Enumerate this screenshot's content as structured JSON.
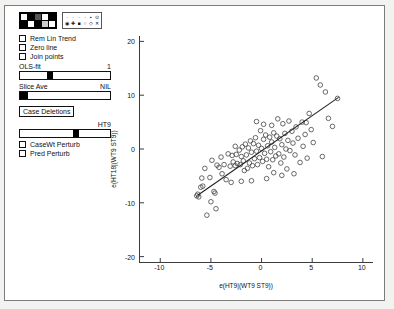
{
  "window": {
    "title": ""
  },
  "panel": {
    "color_palette": {
      "name": "color-palette",
      "swatches": [
        "#ffffff",
        "#000000",
        "#555555",
        "#ffffff",
        "#000000",
        "#000000",
        "#ffffff",
        "#000000",
        "#cccccc",
        "#ffffff"
      ]
    },
    "symbol_palette": {
      "name": "symbol-palette",
      "row1": [
        "·",
        "·",
        "·",
        "·",
        "▪",
        "⊙"
      ],
      "row2": [
        "◉",
        "✚",
        "■",
        "○",
        "◇",
        "✕"
      ]
    },
    "checkboxes": [
      {
        "label": "Rem Lin Trend",
        "checked": false
      },
      {
        "label": "Zero line",
        "checked": false
      },
      {
        "label": "Join points",
        "checked": false
      },
      {
        "label": "CaseWt Perturb",
        "checked": false
      },
      {
        "label": "Pred Perturb",
        "checked": false
      }
    ],
    "sliders": [
      {
        "label": "OLS-fit",
        "value": "1",
        "thumb_pct": 30,
        "thumb_w_pct": 7
      },
      {
        "label": "Slice Ave",
        "value": "NIL",
        "thumb_pct": 0,
        "thumb_w_pct": 9
      },
      {
        "label": "HT9",
        "value": "",
        "thumb_pct": 59,
        "thumb_w_pct": 7
      }
    ],
    "buttons": [
      {
        "label": "Case Deletions"
      }
    ]
  },
  "chart_data": {
    "type": "scatter",
    "title": "",
    "xlabel": "e(HT9|(WT9 ST9))",
    "ylabel": "e(HT18|(WT9 ST9))",
    "xlim": [
      -12,
      11
    ],
    "ylim": [
      -21,
      21
    ],
    "xticks": [
      -10,
      -5,
      0,
      5,
      10
    ],
    "yticks": [
      -20,
      -10,
      0,
      10,
      20
    ],
    "grid": false,
    "legend": null,
    "marker": "open-circle",
    "marker_size": 2.3,
    "marker_color": "#444444",
    "fit_line": {
      "name": "ols-fit-line",
      "color": "#222222",
      "x0": -6.3,
      "y0": -8.6,
      "x1": 7.6,
      "y1": 9.6
    },
    "points": [
      [
        -6.4,
        -8.7
      ],
      [
        -6.3,
        -8.4
      ],
      [
        -6.2,
        -8.9
      ],
      [
        -6.0,
        -7.1
      ],
      [
        -5.9,
        -5.4
      ],
      [
        -5.8,
        -6.9
      ],
      [
        -5.6,
        -3.6
      ],
      [
        -5.4,
        -12.3
      ],
      [
        -5.1,
        -5.3
      ],
      [
        -4.9,
        -2.1
      ],
      [
        -4.7,
        -7.9
      ],
      [
        -4.6,
        -8.2
      ],
      [
        -4.4,
        -3.0
      ],
      [
        -4.2,
        -3.4
      ],
      [
        -4.0,
        -1.5
      ],
      [
        -3.9,
        -4.6
      ],
      [
        -3.7,
        -2.9
      ],
      [
        -3.5,
        -5.7
      ],
      [
        -3.3,
        -0.9
      ],
      [
        -3.1,
        -3.2
      ],
      [
        -2.9,
        -1.2
      ],
      [
        -2.8,
        -2.4
      ],
      [
        -2.6,
        -3.1
      ],
      [
        -2.5,
        -1.0
      ],
      [
        -2.4,
        -2.7
      ],
      [
        -2.2,
        -0.2
      ],
      [
        -2.1,
        -2.9
      ],
      [
        -2.0,
        -1.4
      ],
      [
        -1.9,
        0.4
      ],
      [
        -1.8,
        -2.2
      ],
      [
        -1.7,
        -4.0
      ],
      [
        -1.6,
        0.9
      ],
      [
        -1.5,
        -1.1
      ],
      [
        -1.4,
        -3.6
      ],
      [
        -1.3,
        0.2
      ],
      [
        -1.2,
        -2.6
      ],
      [
        -1.1,
        1.5
      ],
      [
        -1.0,
        -0.6
      ],
      [
        -0.9,
        -3.1
      ],
      [
        -0.8,
        1.0
      ],
      [
        -0.7,
        -1.8
      ],
      [
        -0.6,
        2.1
      ],
      [
        -0.5,
        -0.4
      ],
      [
        -0.4,
        -2.9
      ],
      [
        -0.3,
        0.7
      ],
      [
        -0.2,
        -1.6
      ],
      [
        -0.1,
        3.4
      ],
      [
        0.0,
        0.1
      ],
      [
        0.1,
        -2.3
      ],
      [
        0.2,
        1.8
      ],
      [
        0.3,
        -0.8
      ],
      [
        0.4,
        2.6
      ],
      [
        0.5,
        -1.9
      ],
      [
        0.6,
        0.6
      ],
      [
        0.7,
        -3.3
      ],
      [
        0.8,
        2.2
      ],
      [
        0.9,
        -0.5
      ],
      [
        1.0,
        1.3
      ],
      [
        1.1,
        -2.0
      ],
      [
        1.2,
        3.0
      ],
      [
        1.3,
        0.3
      ],
      [
        1.4,
        -1.3
      ],
      [
        1.5,
        2.4
      ],
      [
        1.6,
        5.6
      ],
      [
        1.7,
        -0.9
      ],
      [
        1.8,
        1.9
      ],
      [
        1.9,
        -2.6
      ],
      [
        2.0,
        0.8
      ],
      [
        2.1,
        4.7
      ],
      [
        2.2,
        -1.5
      ],
      [
        2.3,
        2.9
      ],
      [
        2.4,
        0.0
      ],
      [
        2.5,
        -3.7
      ],
      [
        2.6,
        1.6
      ],
      [
        2.7,
        5.2
      ],
      [
        2.8,
        -0.3
      ],
      [
        3.0,
        3.3
      ],
      [
        3.1,
        1.1
      ],
      [
        3.3,
        -1.1
      ],
      [
        3.4,
        4.1
      ],
      [
        3.6,
        2.0
      ],
      [
        3.8,
        -2.5
      ],
      [
        4.0,
        5.0
      ],
      [
        4.1,
        0.5
      ],
      [
        4.3,
        2.7
      ],
      [
        4.5,
        -1.7
      ],
      [
        4.7,
        6.6
      ],
      [
        4.9,
        3.6
      ],
      [
        5.1,
        1.2
      ],
      [
        5.4,
        13.2
      ],
      [
        5.8,
        11.9
      ],
      [
        6.0,
        -1.4
      ],
      [
        6.3,
        10.6
      ],
      [
        6.6,
        5.7
      ],
      [
        7.0,
        4.2
      ],
      [
        7.5,
        9.4
      ],
      [
        -5.0,
        -9.8
      ],
      [
        -3.0,
        -6.2
      ],
      [
        -2.0,
        -6.0
      ],
      [
        -1.0,
        -5.9
      ],
      [
        0.5,
        -5.5
      ],
      [
        1.2,
        -4.4
      ],
      [
        2.0,
        -4.9
      ],
      [
        3.2,
        -4.6
      ],
      [
        -4.5,
        -11.1
      ],
      [
        -2.6,
        0.5
      ],
      [
        1.0,
        4.4
      ],
      [
        0.2,
        4.6
      ],
      [
        -0.5,
        5.1
      ],
      [
        4.4,
        4.9
      ]
    ]
  }
}
